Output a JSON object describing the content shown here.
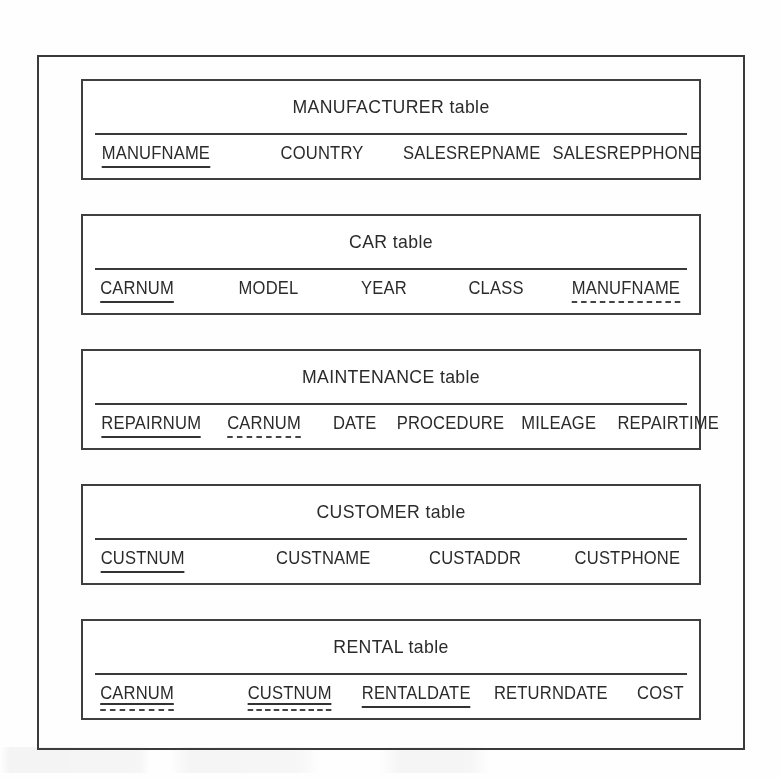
{
  "diagram": {
    "kind": "relational-schema",
    "key_legend": {
      "primary_key": "solid underline",
      "foreign_key": "dashed underline",
      "primary_and_foreign_key": "solid underline over dashed underline"
    },
    "colors": {
      "border": "#3f3f3f",
      "text": "#2b2b2b",
      "background": "#fefefe"
    },
    "tables": [
      {
        "title": "MANUFACTURER table",
        "name": "MANUFACTURER",
        "attributes": [
          {
            "label": "MANUFNAME",
            "key": "pk",
            "flex": "0 0 150px",
            "align": "left"
          },
          {
            "label": "COUNTRY",
            "key": "none",
            "flex": "0 0 150px",
            "align": "center"
          },
          {
            "label": "SALESREPNAME",
            "key": "none",
            "flex": "1 1 auto",
            "align": "center"
          },
          {
            "label": "SALESREPPHONE",
            "key": "none",
            "flex": "0 0 160px",
            "align": "right"
          }
        ]
      },
      {
        "title": "CAR table",
        "name": "CAR",
        "attributes": [
          {
            "label": "CARNUM",
            "key": "pk",
            "flex": "0 0 110px",
            "align": "left"
          },
          {
            "label": "MODEL",
            "key": "none",
            "flex": "1 1 auto",
            "align": "center"
          },
          {
            "label": "YEAR",
            "key": "none",
            "flex": "1 1 auto",
            "align": "center"
          },
          {
            "label": "CLASS",
            "key": "none",
            "flex": "1 1 auto",
            "align": "center"
          },
          {
            "label": "MANUFNAME",
            "key": "fk",
            "flex": "0 0 130px",
            "align": "right"
          }
        ]
      },
      {
        "title": "MAINTENANCE table",
        "name": "MAINTENANCE",
        "attributes": [
          {
            "label": "REPAIRNUM",
            "key": "pk",
            "flex": "0 0 115px",
            "align": "left"
          },
          {
            "label": "CARNUM",
            "key": "fk",
            "flex": "0 0 105px",
            "align": "center"
          },
          {
            "label": "DATE",
            "key": "none",
            "flex": "0 0 75px",
            "align": "center"
          },
          {
            "label": "PROCEDURE",
            "key": "none",
            "flex": "1 1 auto",
            "align": "center"
          },
          {
            "label": "MILEAGE",
            "key": "none",
            "flex": "0 0 100px",
            "align": "center"
          },
          {
            "label": "REPAIRTIME",
            "key": "none",
            "flex": "0 0 115px",
            "align": "right"
          }
        ]
      },
      {
        "title": "CUSTOMER table",
        "name": "CUSTOMER",
        "attributes": [
          {
            "label": "CUSTNUM",
            "key": "pk",
            "flex": "0 0 150px",
            "align": "left"
          },
          {
            "label": "CUSTNAME",
            "key": "none",
            "flex": "1 1 auto",
            "align": "center"
          },
          {
            "label": "CUSTADDR",
            "key": "none",
            "flex": "1 1 auto",
            "align": "center"
          },
          {
            "label": "CUSTPHONE",
            "key": "none",
            "flex": "0 0 135px",
            "align": "right"
          }
        ]
      },
      {
        "title": "RENTAL table",
        "name": "RENTAL",
        "attributes": [
          {
            "label": "CARNUM",
            "key": "pkfk",
            "flex": "0 0 125px",
            "align": "left"
          },
          {
            "label": "CUSTNUM",
            "key": "pkfk",
            "flex": "0 0 135px",
            "align": "center"
          },
          {
            "label": "RENTALDATE",
            "key": "pk",
            "flex": "1 1 auto",
            "align": "center"
          },
          {
            "label": "RETURNDATE",
            "key": "none",
            "flex": "0 0 150px",
            "align": "center"
          },
          {
            "label": "COST",
            "key": "none",
            "flex": "0 0 60px",
            "align": "right"
          }
        ]
      }
    ]
  }
}
